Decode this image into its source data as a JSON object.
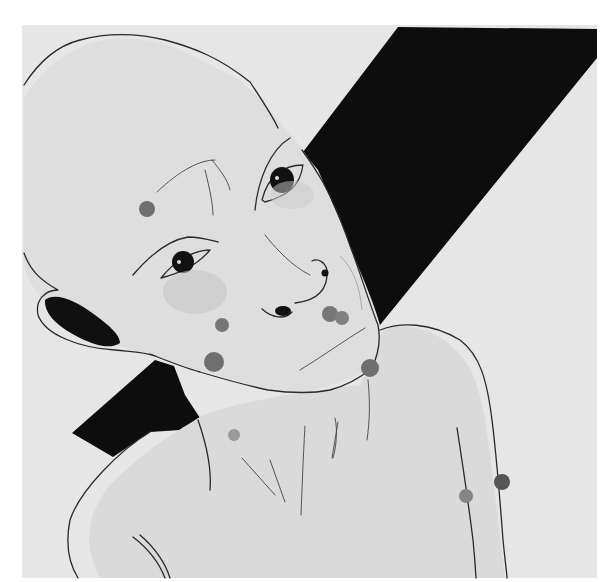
{
  "artwork": {
    "kind": "ink and wash drawing",
    "subject": "bald figure with tilted head and spotted skin",
    "colors": {
      "page": "#ffffff",
      "paper": "#e6e6e6",
      "skin": "#dcdcdc",
      "band": "#0d0d0d",
      "ink": "#2a2a2a",
      "spot": "#777777",
      "shadow": "#c4c4c4"
    },
    "paper_bounds": {
      "x": 22,
      "y": 25,
      "width": 575,
      "height": 553
    }
  }
}
